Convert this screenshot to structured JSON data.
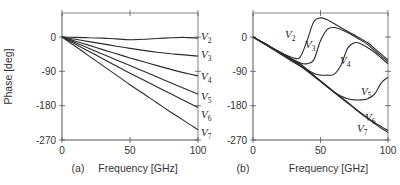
{
  "figure": {
    "panels": [
      "(a)",
      "(b)"
    ]
  },
  "chart_data": [
    {
      "type": "line",
      "panel_label": "(a)",
      "title": "",
      "xlabel": "Frequency [GHz]",
      "ylabel": "Phase [deg]",
      "xlim": [
        0,
        100
      ],
      "ylim": [
        -270,
        63
      ],
      "xticks": [
        0,
        50,
        100
      ],
      "yticks": [
        0,
        -90,
        -180,
        -270
      ],
      "grid": false,
      "legend": "inline labels at right edge",
      "x": [
        0,
        10,
        20,
        30,
        40,
        50,
        60,
        70,
        80,
        90,
        100
      ],
      "series": [
        {
          "name": "V2",
          "values": [
            0,
            -1,
            -2,
            -3,
            -5,
            -7,
            -6,
            -4,
            -2,
            -1,
            -3
          ]
        },
        {
          "name": "V3",
          "values": [
            0,
            -6,
            -12,
            -18,
            -24,
            -30,
            -35,
            -40,
            -44,
            -47,
            -50
          ]
        },
        {
          "name": "V4",
          "values": [
            0,
            -11,
            -22,
            -33,
            -44,
            -55,
            -65,
            -75,
            -85,
            -94,
            -102
          ]
        },
        {
          "name": "V5",
          "values": [
            0,
            -15,
            -30,
            -45,
            -60,
            -75,
            -90,
            -105,
            -120,
            -135,
            -150
          ]
        },
        {
          "name": "V6",
          "values": [
            0,
            -19,
            -38,
            -57,
            -76,
            -95,
            -113,
            -131,
            -149,
            -167,
            -185
          ]
        },
        {
          "name": "V7",
          "values": [
            0,
            -25,
            -50,
            -75,
            -100,
            -125,
            -149,
            -173,
            -197,
            -220,
            -243
          ]
        }
      ]
    },
    {
      "type": "line",
      "panel_label": "(b)",
      "title": "",
      "xlabel": "Frequency [GHz]",
      "ylabel": "",
      "xlim": [
        0,
        100
      ],
      "ylim": [
        -270,
        63
      ],
      "xticks": [
        0,
        50,
        100
      ],
      "yticks": [
        0,
        -90,
        -180,
        -270
      ],
      "grid": false,
      "legend": "inline labels next to curves",
      "x": [
        0,
        10,
        20,
        30,
        35,
        40,
        45,
        50,
        55,
        60,
        65,
        70,
        75,
        80,
        85,
        90,
        95,
        100
      ],
      "series": [
        {
          "name": "V2",
          "values": [
            0,
            -20,
            -40,
            -55,
            -52,
            -10,
            40,
            50,
            45,
            35,
            25,
            15,
            5,
            -5,
            -15,
            -30,
            -45,
            -60
          ]
        },
        {
          "name": "V3",
          "values": [
            0,
            -20,
            -40,
            -60,
            -68,
            -70,
            -60,
            -10,
            20,
            25,
            20,
            12,
            2,
            -8,
            -20,
            -35,
            -50,
            -65
          ]
        },
        {
          "name": "V4",
          "values": [
            0,
            -20,
            -40,
            -60,
            -70,
            -85,
            -95,
            -100,
            -100,
            -98,
            -75,
            -30,
            -15,
            -18,
            -28,
            -40,
            -55,
            -70
          ]
        },
        {
          "name": "V5",
          "values": [
            0,
            -20,
            -40,
            -62,
            -72,
            -85,
            -100,
            -115,
            -130,
            -145,
            -155,
            -162,
            -165,
            -165,
            -162,
            -150,
            -120,
            -105
          ]
        },
        {
          "name": "V6",
          "values": [
            0,
            -21,
            -42,
            -64,
            -75,
            -87,
            -101,
            -115,
            -129,
            -143,
            -157,
            -171,
            -185,
            -199,
            -212,
            -224,
            -235,
            -245
          ]
        },
        {
          "name": "V7",
          "values": [
            0,
            -22,
            -44,
            -66,
            -77,
            -89,
            -103,
            -117,
            -131,
            -145,
            -159,
            -173,
            -187,
            -201,
            -214,
            -227,
            -239,
            -250
          ]
        }
      ]
    }
  ]
}
